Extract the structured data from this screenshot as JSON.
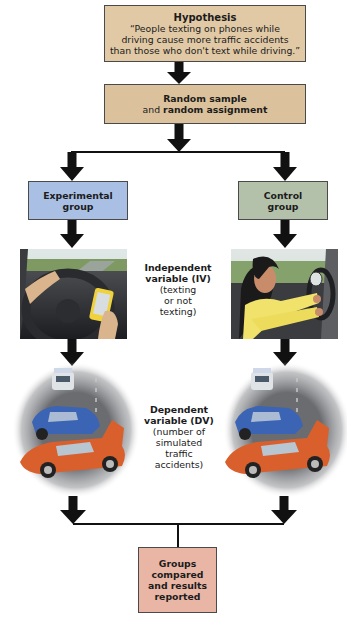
{
  "diagram": {
    "type": "experimental-design-flowchart",
    "hypothesis": {
      "title": "Hypothesis",
      "lines": [
        "“People texting on phones while",
        "driving cause more traffic accidents",
        "than those who don't text while driving.”"
      ],
      "color": "#e1c9a6"
    },
    "sampling": {
      "line1": "Random sample",
      "line2_prefix": "and ",
      "line2_bold": "random assignment",
      "color": "#dcc29c"
    },
    "groups": {
      "experimental": {
        "line1": "Experimental",
        "line2": "group",
        "color": "#a9c0e4",
        "image": "driver-texting-on-phone"
      },
      "control": {
        "line1": "Control",
        "line2": "group",
        "color": "#b4c1aa",
        "image": "driver-with-hands-on-wheel"
      }
    },
    "independent_variable": {
      "title_line1": "Independent",
      "title_line2": "variable (IV)",
      "detail_lines": [
        "(texting",
        "or not",
        "texting)"
      ]
    },
    "dependent_variable": {
      "title_line1": "Dependent",
      "title_line2": "variable (DV)",
      "detail_lines": [
        "(number of",
        "simulated",
        "traffic",
        "accidents)"
      ],
      "image": "car-crash-scene"
    },
    "result": {
      "lines": [
        "Groups",
        "compared",
        "and results",
        "reported"
      ],
      "color": "#e9b6a6"
    }
  }
}
